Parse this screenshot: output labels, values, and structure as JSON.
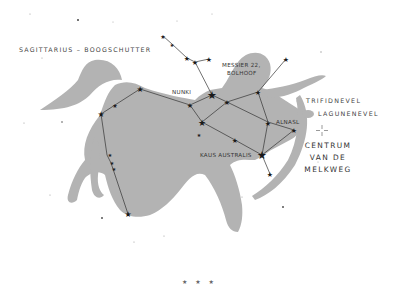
{
  "title": "SAGITTARIUS – BOOGSCHUTTER",
  "labels": {
    "nunki": "NUNKI",
    "messier_line1": "MESSIER 22,",
    "messier_line2": "BOLHOOF",
    "alnasl": "ALNASL",
    "kaus_australis": "KAUS AUSTRALIS"
  },
  "legend": {
    "trifid": "TRIFIDNEVEL",
    "lagoon": "LAGUNENEVEL"
  },
  "galactic_center": {
    "line1": "CENTRUM",
    "line2": "VAN DE",
    "line3": "MELKWEG"
  },
  "footer": "★ ★ ★",
  "colors": {
    "figure": "#b3b3b3",
    "lines": "#333333",
    "stars": "#1a1a1a",
    "background": "#ffffff"
  }
}
